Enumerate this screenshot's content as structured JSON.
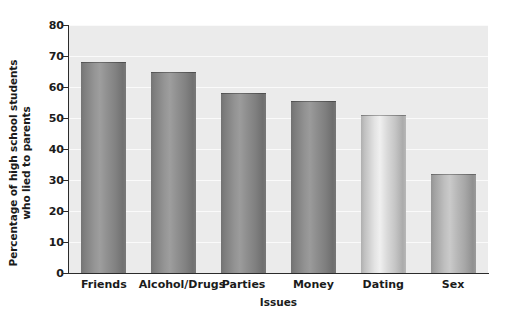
{
  "chart_data": {
    "type": "bar",
    "title": "",
    "subtitle": "",
    "categories": [
      "Friends",
      "Alcohol/Drugs",
      "Parties",
      "Money",
      "Dating",
      "Sex"
    ],
    "values": [
      68,
      65,
      58,
      55.5,
      51,
      32
    ],
    "xlabel": "Issues",
    "ylabel_lines": [
      "Percentage of high school students",
      "who lied to parents"
    ],
    "ylabel": "Percentage of high school students who lied to parents",
    "ylim": [
      0,
      80
    ],
    "ytick_labels": [
      "0",
      "10",
      "20",
      "30",
      "40",
      "50",
      "60",
      "70",
      "80"
    ],
    "ytick_values": [
      0,
      10,
      20,
      30,
      40,
      50,
      60,
      70,
      80
    ],
    "ytick_step": 10,
    "grid": "horizontal",
    "legend": "none",
    "orientation": "vertical",
    "bar_style": "cylindrical-3d-gradient",
    "bar_colors": [
      "#8d8d8d",
      "#8d8d8d",
      "#8b8b8b",
      "#8a8a8a",
      "#d6d6d6",
      "#b4b4b4"
    ],
    "plot_background": "#ebebeb",
    "gridline_color": "#fafafa",
    "axis_color": "#2b2b2b",
    "page_background": "#ffffff"
  }
}
